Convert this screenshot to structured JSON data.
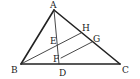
{
  "diagram": {
    "type": "geometry-triangle",
    "points": {
      "A": {
        "label": "A",
        "x": 54,
        "y": 10,
        "lx": 50,
        "ly": 8
      },
      "B": {
        "label": "B",
        "x": 21,
        "y": 64,
        "lx": 11,
        "ly": 73
      },
      "C": {
        "label": "C",
        "x": 120,
        "y": 64,
        "lx": 122,
        "ly": 73
      },
      "D": {
        "label": "D",
        "x": 59,
        "y": 64,
        "lx": 59,
        "ly": 76
      },
      "E": {
        "label": "E",
        "x": 59,
        "y": 44,
        "lx": 50,
        "ly": 44
      },
      "F": {
        "label": "F",
        "x": 61,
        "y": 58,
        "lx": 53,
        "ly": 62
      },
      "G": {
        "label": "G",
        "x": 92,
        "y": 42,
        "lx": 93,
        "ly": 42
      },
      "H": {
        "label": "H",
        "x": 81,
        "y": 33,
        "lx": 82,
        "ly": 31
      }
    },
    "segments": [
      {
        "name": "AB",
        "from": "A",
        "to": "B",
        "style": "thick"
      },
      {
        "name": "AC",
        "from": "A",
        "to": "C",
        "style": "thick"
      },
      {
        "name": "BC",
        "from": "B",
        "to": "C",
        "style": "thick"
      },
      {
        "name": "AD",
        "from": "A",
        "to": "D",
        "style": "thin"
      },
      {
        "name": "BH",
        "from": "B",
        "to": "H",
        "style": "thin"
      },
      {
        "name": "FG",
        "from": "F",
        "to": "G",
        "style": "thin"
      }
    ]
  }
}
